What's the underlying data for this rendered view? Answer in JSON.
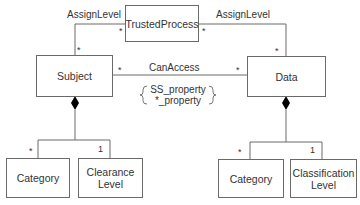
{
  "diagram": {
    "type": "uml-class-diagram",
    "classes": {
      "trusted_process": "TrustedProcess",
      "subject": "Subject",
      "data": "Data",
      "subject_category": "Category",
      "clearance_level": "Clearance\nLevel",
      "data_category": "Category",
      "classification_level": "Classification\nLevel"
    },
    "associations": {
      "assign_level_left": "AssignLevel",
      "assign_level_right": "AssignLevel",
      "can_access": "CanAccess"
    },
    "constraint": {
      "line1": "SS_property",
      "line2": "*_property"
    },
    "multiplicities": {
      "tp_left": "*",
      "subject_top": "*",
      "tp_right": "*",
      "data_top": "*",
      "subject_right": "*",
      "data_left": "*",
      "subject_category": "*",
      "clearance_level": "1",
      "data_category": "*",
      "classification_level": "1"
    },
    "colors": {
      "line": "#6a6a6a",
      "text": "#333333",
      "diamond": "#000000"
    }
  }
}
